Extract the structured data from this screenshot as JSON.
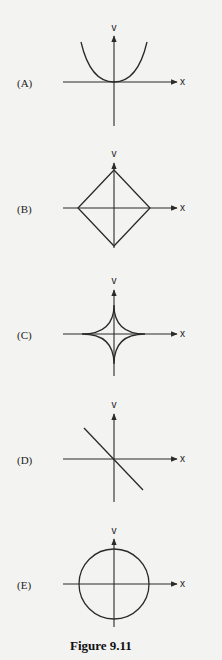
{
  "figure": {
    "caption": "Figure 9.11",
    "stroke_color": "#2a2a2a",
    "background": "#f3f3f1"
  },
  "panels": [
    {
      "label": "(A)",
      "y_axis_label": "v",
      "x_axis_label": "x",
      "curve": "parabola (U-shape, vertex at origin)"
    },
    {
      "label": "(B)",
      "y_axis_label": "v",
      "x_axis_label": "x",
      "curve": "diamond (square rotated 45°, vertices on axes)"
    },
    {
      "label": "(C)",
      "y_axis_label": "v",
      "x_axis_label": "x",
      "curve": "astroid (four inward-curved cusps on axes)"
    },
    {
      "label": "(D)",
      "y_axis_label": "v",
      "x_axis_label": "x",
      "curve": "straight line with negative slope through origin"
    },
    {
      "label": "(E)",
      "y_axis_label": "v",
      "x_axis_label": "x",
      "curve": "circle centered at origin"
    }
  ]
}
